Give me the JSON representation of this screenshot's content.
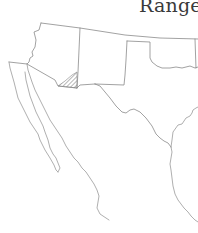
{
  "map": {
    "title": "Range",
    "region": "Southwestern United States and Mexico",
    "range_highlight": {
      "description": "hatched range area in southeastern Arizona / southwestern New Mexico border region",
      "pattern": "diagonal-hatch",
      "color": "#7a7a7a"
    },
    "colors": {
      "background": "#ffffff",
      "border": "#8a8a8a",
      "title": "#3a3a3a"
    }
  }
}
